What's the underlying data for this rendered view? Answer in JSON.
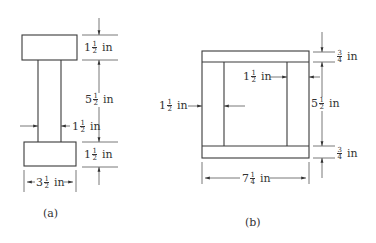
{
  "figure_a": {
    "caption": "(a)",
    "dims": {
      "top_flange_height": {
        "whole": "1",
        "num": "1",
        "den": "2",
        "unit": "in"
      },
      "web_height": {
        "whole": "5",
        "num": "1",
        "den": "2",
        "unit": "in"
      },
      "web_thickness": {
        "whole": "1",
        "num": "1",
        "den": "2",
        "unit": "in"
      },
      "bottom_flange_height": {
        "whole": "1",
        "num": "1",
        "den": "2",
        "unit": "in"
      },
      "flange_width": {
        "whole": "3",
        "num": "1",
        "den": "2",
        "unit": "in"
      }
    }
  },
  "figure_b": {
    "caption": "(b)",
    "dims": {
      "top_plank_thickness": {
        "whole": "",
        "num": "3",
        "den": "4",
        "unit": "in"
      },
      "inner_side_thickness": {
        "whole": "1",
        "num": "1",
        "den": "2",
        "unit": "in"
      },
      "left_side_thickness": {
        "whole": "1",
        "num": "1",
        "den": "2",
        "unit": "in"
      },
      "inner_height": {
        "whole": "5",
        "num": "1",
        "den": "2",
        "unit": "in"
      },
      "bottom_plank_thickness": {
        "whole": "",
        "num": "3",
        "den": "4",
        "unit": "in"
      },
      "overall_width": {
        "whole": "7",
        "num": "1",
        "den": "4",
        "unit": "in"
      }
    }
  },
  "colors": {
    "line": "#3a3a3a",
    "background": "#ffffff"
  }
}
